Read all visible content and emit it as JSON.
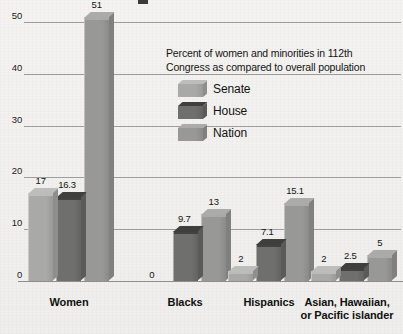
{
  "chart_data": {
    "type": "bar",
    "title": "",
    "xlabel": "",
    "ylabel": "",
    "ylim": [
      0,
      55
    ],
    "grid": true,
    "legend_position": "inside-upper-right",
    "categories": [
      "Women",
      "Blacks",
      "Hispanics",
      "Asian, Hawaiian, or Pacific islander"
    ],
    "series": [
      {
        "name": "Senate",
        "color": "#a9a9a7",
        "values": [
          17,
          0,
          2,
          2
        ]
      },
      {
        "name": "House",
        "color": "#6f6f6d",
        "values": [
          16.3,
          9.7,
          7.1,
          2.5
        ]
      },
      {
        "name": "Nation",
        "color": "#989896",
        "values": [
          51,
          13,
          15.1,
          5
        ]
      }
    ],
    "value_labels": [
      [
        "17",
        "16.3",
        "51"
      ],
      [
        "0",
        "9.7",
        "13"
      ],
      [
        "2",
        "7.1",
        "15.1"
      ],
      [
        "2",
        "2.5",
        "5"
      ]
    ],
    "yticks": [
      "0",
      "10",
      "20",
      "30",
      "40",
      "50"
    ],
    "ytick_values": [
      0,
      10,
      20,
      30,
      40,
      50
    ]
  },
  "legend": {
    "caption_line1": "Percent of women and minorities in  112th",
    "caption_line2": "Congress as compared to overall population",
    "items": [
      {
        "label": "Senate",
        "swatch": "senate-swatch"
      },
      {
        "label": "House",
        "swatch": "house-swatch"
      },
      {
        "label": "Nation",
        "swatch": "nation-swatch"
      }
    ]
  },
  "axis": {
    "category_labels": [
      {
        "line1": "Women",
        "line2": ""
      },
      {
        "line1": "Blacks",
        "line2": ""
      },
      {
        "line1": "Hispanics",
        "line2": ""
      },
      {
        "line1": "Asian, Hawaiian,",
        "line2": "or Pacific islander"
      }
    ]
  },
  "colors": {
    "senate_front": "#a9a9a7",
    "senate_top": "#bdbdbb",
    "senate_side": "#8e8e8c",
    "house_front": "#6f6f6d",
    "house_top": "#3f3f3d",
    "house_side": "#5a5a58",
    "nation_front": "#989896",
    "nation_top": "#abab a9",
    "nation_side": "#80807e",
    "gridline": "#9d9d9d",
    "background": "#f2f1ef",
    "text": "#141414"
  }
}
